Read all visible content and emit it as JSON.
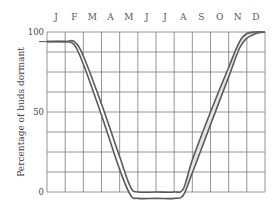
{
  "chart_data": {
    "type": "area",
    "title": "",
    "xlabel": "",
    "ylabel": "Percentage of buds dormant",
    "x_tick_labels": [
      "J",
      "F",
      "M",
      "A",
      "M",
      "J",
      "J",
      "A",
      "S",
      "O",
      "N",
      "D"
    ],
    "y_tick_labels": [
      "0",
      "50",
      "100"
    ],
    "ylim": [
      0,
      100
    ],
    "grid": true,
    "legend": null,
    "x": [
      0.0,
      1.0,
      1.5,
      2.0,
      3.0,
      4.0,
      4.6,
      5.0,
      6.0,
      7.0,
      7.5,
      8.0,
      9.0,
      10.0,
      10.6,
      11.0,
      11.5,
      12.0
    ],
    "series": [
      {
        "name": "upper bound",
        "values": [
          94,
          94,
          94,
          85,
          55,
          22,
          3,
          0,
          0,
          0,
          2,
          20,
          50,
          78,
          94,
          99,
          100,
          100
        ]
      },
      {
        "name": "lower bound",
        "values": [
          94,
          94,
          92,
          80,
          48,
          14,
          -2,
          -4,
          -4,
          -4,
          -2,
          12,
          42,
          72,
          90,
          96,
          99,
          100
        ]
      }
    ],
    "note": "Band between two curves: buds ~95-100% dormant Jan-Feb, decline through Mar-May to ~0% in Jun-Aug, rise again Sep-Dec back to ~100%; band shaded during autumn rise."
  }
}
